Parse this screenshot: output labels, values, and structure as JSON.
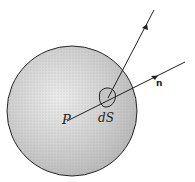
{
  "diagram": {
    "type": "sphere-with-surface-element",
    "labels": {
      "point": "P",
      "surface_element": "dS",
      "normal": "n"
    },
    "colors": {
      "stroke": "#222222",
      "fill": "#d6d6d6",
      "background": "#ffffff"
    }
  }
}
